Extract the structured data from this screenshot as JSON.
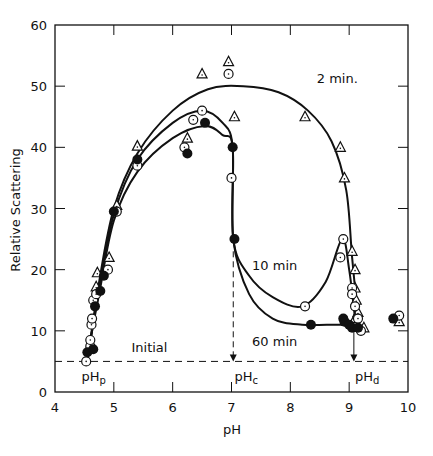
{
  "chart_data": {
    "type": "scatter",
    "title": "",
    "xlabel": "pH",
    "ylabel": "Relative Scattering",
    "xlim": [
      4,
      10
    ],
    "ylim": [
      0,
      60
    ],
    "xticks": [
      4,
      5,
      6,
      7,
      8,
      9,
      10
    ],
    "yticks": [
      0,
      10,
      20,
      30,
      40,
      50,
      60
    ],
    "grid": false,
    "legend": "inline curve labels",
    "initial_level": 5,
    "annotations": [
      {
        "text": "Initial",
        "x": 5.3,
        "y": 6.5
      },
      {
        "text": "2 min.",
        "x": 8.45,
        "y": 50.5
      },
      {
        "text": "10 min",
        "x": 7.35,
        "y": 20
      },
      {
        "text": "60 min",
        "x": 7.35,
        "y": 7.5
      },
      {
        "text": "pHp",
        "x": 4.45,
        "y": 1.8
      },
      {
        "text": "pHc",
        "x": 7.05,
        "y": 1.8
      },
      {
        "text": "pHd",
        "x": 9.1,
        "y": 1.8
      }
    ],
    "markers": {
      "pHp": 4.55,
      "pHc": 7.03,
      "pHd": 9.08
    },
    "series": [
      {
        "name": "2 min",
        "marker": "open-triangle",
        "points": [
          [
            4.72,
            19.5
          ],
          [
            4.7,
            17.2
          ],
          [
            4.92,
            22
          ],
          [
            5.05,
            30.5
          ],
          [
            5.4,
            40.2
          ],
          [
            6.25,
            41.5
          ],
          [
            6.5,
            52
          ],
          [
            6.95,
            54
          ],
          [
            7.05,
            45
          ],
          [
            8.25,
            45
          ],
          [
            8.85,
            40
          ],
          [
            8.92,
            35
          ],
          [
            9.05,
            23
          ],
          [
            9.1,
            20
          ],
          [
            9.1,
            17
          ],
          [
            9.12,
            15
          ],
          [
            9.15,
            13
          ],
          [
            9.1,
            12
          ],
          [
            9.25,
            10.5
          ],
          [
            9.85,
            11.5
          ]
        ],
        "curve": [
          [
            4.55,
            5
          ],
          [
            4.75,
            18
          ],
          [
            5.0,
            30
          ],
          [
            5.4,
            39
          ],
          [
            6.0,
            46
          ],
          [
            6.6,
            49.5
          ],
          [
            7.2,
            50
          ],
          [
            7.8,
            49
          ],
          [
            8.3,
            46
          ],
          [
            8.7,
            41
          ],
          [
            8.95,
            33
          ],
          [
            9.05,
            22
          ],
          [
            9.15,
            12
          ]
        ]
      },
      {
        "name": "10 min",
        "marker": "open-circle",
        "points": [
          [
            4.53,
            5
          ],
          [
            4.6,
            7.5
          ],
          [
            4.6,
            8.5
          ],
          [
            4.62,
            11
          ],
          [
            4.63,
            12
          ],
          [
            4.65,
            15
          ],
          [
            4.7,
            16
          ],
          [
            4.9,
            20
          ],
          [
            5.05,
            29.5
          ],
          [
            5.4,
            37
          ],
          [
            6.2,
            40
          ],
          [
            6.35,
            44.5
          ],
          [
            6.5,
            46
          ],
          [
            6.95,
            52
          ],
          [
            7.0,
            35
          ],
          [
            8.25,
            14
          ],
          [
            8.85,
            22
          ],
          [
            8.9,
            25
          ],
          [
            9.05,
            17
          ],
          [
            9.05,
            16
          ],
          [
            9.1,
            14
          ],
          [
            9.15,
            12
          ],
          [
            9.2,
            10
          ],
          [
            9.85,
            12.5
          ]
        ],
        "curve": [
          [
            4.55,
            5
          ],
          [
            4.75,
            17
          ],
          [
            5.0,
            29
          ],
          [
            5.4,
            38
          ],
          [
            6.0,
            44
          ],
          [
            6.5,
            46
          ],
          [
            6.85,
            44
          ],
          [
            7.02,
            40
          ],
          [
            7.03,
            25
          ],
          [
            7.3,
            19
          ],
          [
            7.7,
            15.5
          ],
          [
            8.2,
            14
          ],
          [
            8.6,
            18
          ],
          [
            8.88,
            25
          ],
          [
            9.0,
            20
          ],
          [
            9.1,
            12
          ]
        ]
      },
      {
        "name": "60 min",
        "marker": "filled-circle",
        "points": [
          [
            4.55,
            6.5
          ],
          [
            4.65,
            7
          ],
          [
            4.68,
            14
          ],
          [
            4.77,
            16.5
          ],
          [
            4.83,
            19
          ],
          [
            5.0,
            29.5
          ],
          [
            5.4,
            38
          ],
          [
            6.25,
            39
          ],
          [
            6.55,
            44
          ],
          [
            7.02,
            40
          ],
          [
            7.05,
            25
          ],
          [
            8.35,
            11
          ],
          [
            8.9,
            12
          ],
          [
            8.92,
            11.5
          ],
          [
            9.0,
            11
          ],
          [
            9.05,
            10.5
          ],
          [
            9.15,
            10.5
          ],
          [
            9.75,
            12
          ]
        ],
        "curve": [
          [
            4.55,
            6
          ],
          [
            4.75,
            16
          ],
          [
            5.0,
            28
          ],
          [
            5.4,
            36
          ],
          [
            6.0,
            41.5
          ],
          [
            6.55,
            43.5
          ],
          [
            6.85,
            42
          ],
          [
            7.02,
            40
          ],
          [
            7.03,
            25
          ],
          [
            7.3,
            16
          ],
          [
            7.7,
            12
          ],
          [
            8.2,
            11
          ],
          [
            8.9,
            11
          ],
          [
            9.15,
            10.5
          ]
        ]
      }
    ]
  }
}
